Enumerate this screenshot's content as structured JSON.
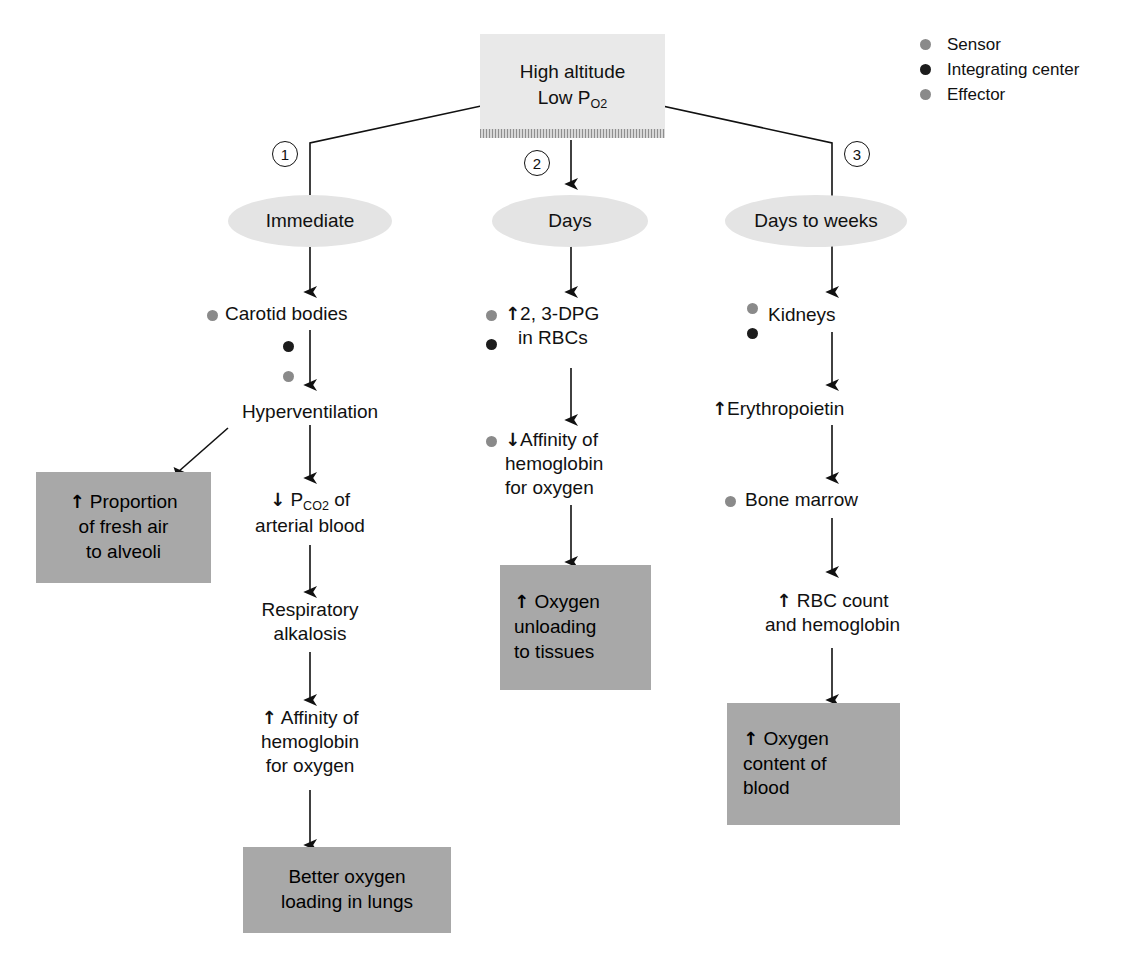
{
  "legend": {
    "items": [
      {
        "label": "Sensor",
        "icon": "sensor-dot-icon",
        "color": "#8a8a8a"
      },
      {
        "label": "Integrating center",
        "icon": "integrating-center-dot-icon",
        "color": "#1c1c1c"
      },
      {
        "label": "Effector",
        "icon": "effector-dot-icon",
        "color": "#8a8a8a"
      }
    ]
  },
  "stimulus": {
    "line1": "High altitude",
    "line2_prefix": "Low P",
    "line2_sub": "O",
    "line2_sub2": "2"
  },
  "branches": [
    {
      "number": "1",
      "timing": "Immediate",
      "steps": [
        {
          "text": "Carotid bodies"
        },
        {
          "text": "Hyperventilation"
        },
        {
          "text": "Proportion of fresh air to alveoli",
          "arrow": "up",
          "box": true,
          "lines": [
            "Proportion",
            "of fresh air",
            "to alveoli"
          ]
        },
        {
          "text": "PCO2 of arterial blood",
          "arrow": "down",
          "lines": [
            "P_CO2 of",
            "arterial blood"
          ]
        },
        {
          "text": "Respiratory alkalosis",
          "lines": [
            "Respiratory",
            "alkalosis"
          ]
        },
        {
          "text": "Affinity of hemoglobin for oxygen",
          "arrow": "up",
          "lines": [
            "Affinity of",
            "hemoglobin",
            "for oxygen"
          ]
        },
        {
          "text": "Better oxygen loading in lungs",
          "box": true,
          "lines": [
            "Better oxygen",
            "loading in lungs"
          ]
        }
      ]
    },
    {
      "number": "2",
      "timing": "Days",
      "steps": [
        {
          "text": "2, 3-DPG in RBCs",
          "arrow": "up",
          "lines": [
            "2, 3-DPG",
            "in RBCs"
          ]
        },
        {
          "text": "Affinity of hemoglobin for oxygen",
          "arrow": "down",
          "lines": [
            "Affinity of",
            "hemoglobin",
            "for oxygen"
          ]
        },
        {
          "text": "Oxygen unloading to tissues",
          "arrow": "up",
          "box": true,
          "lines": [
            "Oxygen",
            "unloading",
            "to tissues"
          ]
        }
      ]
    },
    {
      "number": "3",
      "timing": "Days to weeks",
      "steps": [
        {
          "text": "Kidneys"
        },
        {
          "text": "Erythropoietin",
          "arrow": "up"
        },
        {
          "text": "Bone marrow"
        },
        {
          "text": "RBC count and hemoglobin",
          "arrow": "up",
          "lines": [
            "RBC count",
            "and hemoglobin"
          ]
        },
        {
          "text": "Oxygen content of blood",
          "arrow": "up",
          "box": true,
          "lines": [
            "Oxygen",
            "content of",
            "blood"
          ]
        }
      ]
    }
  ],
  "labels": {
    "carotid_bodies": "Carotid bodies",
    "hyperventilation": "Hyperventilation",
    "proportion_l1": "Proportion",
    "proportion_l2": "of fresh air",
    "proportion_l3": "to alveoli",
    "pco2_l1_pre": "P",
    "pco2_l1_sub": "CO",
    "pco2_l1_sub2": "2",
    "pco2_l1_post": " of",
    "pco2_l2": "arterial blood",
    "resp_l1": "Respiratory",
    "resp_l2": "alkalosis",
    "affinity_up_l1": "Affinity of",
    "affinity_up_l2": "hemoglobin",
    "affinity_up_l3": "for oxygen",
    "better_l1": "Better oxygen",
    "better_l2": "loading in lungs",
    "dpg_l1": "2, 3-DPG",
    "dpg_l2": "in RBCs",
    "affinity_dn_l1": "Affinity of",
    "affinity_dn_l2": "hemoglobin",
    "affinity_dn_l3": "for oxygen",
    "unload_l1": "Oxygen",
    "unload_l2": "unloading",
    "unload_l3": "to tissues",
    "kidneys": "Kidneys",
    "erythropoietin": "Erythropoietin",
    "bone_marrow": "Bone marrow",
    "rbc_l1": "RBC count",
    "rbc_l2": "and hemoglobin",
    "content_l1": "Oxygen",
    "content_l2": "content of",
    "content_l3": "blood",
    "timing_immediate": "Immediate",
    "timing_days": "Days",
    "timing_days_weeks": "Days to weeks",
    "step1": "1",
    "step2": "2",
    "step3": "3",
    "arrow_up": "↑",
    "arrow_down": "↓"
  },
  "colors": {
    "stimulus_box": "#e9e9e9",
    "oval": "#e4e4e4",
    "outcome_box": "#a8a8a8",
    "sensor": "#8a8a8a",
    "integrating_center": "#1c1c1c",
    "effector": "#8a8a8a",
    "line": "#111111"
  }
}
